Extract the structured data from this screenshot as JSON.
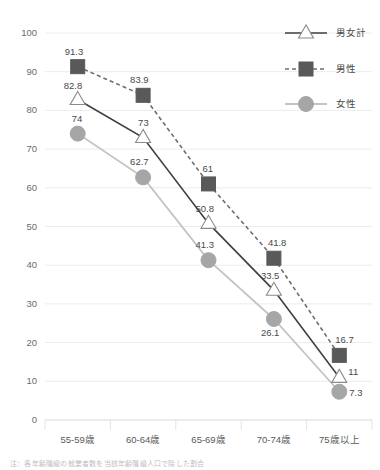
{
  "chart_data": {
    "type": "line",
    "title": "",
    "xlabel": "",
    "ylabel": "",
    "ylim": [
      0,
      100
    ],
    "ytick_step": 10,
    "grid": true,
    "legend_position": "top-right",
    "categories": [
      "55-59歳",
      "60-64歳",
      "65-69歳",
      "70-74歳",
      "75歳以上"
    ],
    "yticks": [
      "0",
      "10",
      "20",
      "30",
      "40",
      "50",
      "60",
      "70",
      "80",
      "90",
      "100"
    ],
    "series": [
      {
        "name": "男女計",
        "marker": "triangle",
        "line_style": "solid",
        "color": "#3f3f3f",
        "marker_fill": "#ffffff",
        "marker_stroke": "#8a8a8a",
        "values": [
          82.8,
          73,
          50.8,
          33.5,
          11
        ],
        "labels": [
          "82.8",
          "73",
          "50.8",
          "33.5",
          "11"
        ]
      },
      {
        "name": "男性",
        "marker": "square",
        "line_style": "dashed",
        "color": "#6e6e6e",
        "marker_fill": "#595959",
        "marker_stroke": "#595959",
        "values": [
          91.3,
          83.9,
          61,
          41.8,
          16.7
        ],
        "labels": [
          "91.3",
          "83.9",
          "61",
          "41.8",
          "16.7"
        ]
      },
      {
        "name": "女性",
        "marker": "circle",
        "line_style": "solid",
        "color": "#c4c4c4",
        "marker_fill": "#a6a6a6",
        "marker_stroke": "#a6a6a6",
        "values": [
          74,
          62.7,
          41.3,
          26.1,
          7.3
        ],
        "labels": [
          "74",
          "62.7",
          "41.3",
          "26.1",
          "7.3"
        ]
      }
    ]
  },
  "legend": {
    "items": [
      {
        "label": "男女計"
      },
      {
        "label": "男性"
      },
      {
        "label": "女性"
      }
    ]
  },
  "footnote": {
    "text": "注：各年齢階級の就業者数を当該年齢階級人口で除した割合"
  },
  "colors": {
    "background": "#ffffff",
    "grid": "#ececec",
    "axis": "#d9d9d9",
    "total_line": "#3f3f3f",
    "male_line": "#6e6e6e",
    "female_line": "#c4c4c4",
    "male_marker": "#595959",
    "female_marker": "#a6a6a6",
    "tick_text": "#6b6b6b",
    "label_text": "#4a4a4a"
  }
}
